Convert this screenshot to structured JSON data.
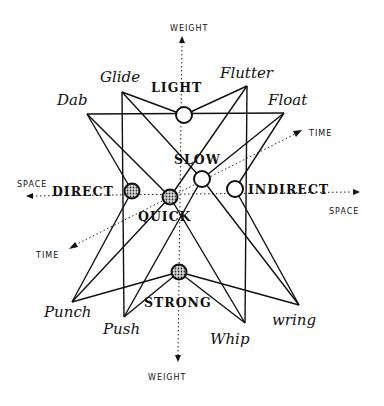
{
  "diagram": {
    "axes": {
      "weight_top": "WEIGHT",
      "weight_bottom": "WEIGHT",
      "space_left": "SPACE",
      "space_right": "SPACE",
      "time_top_right": "TIME",
      "time_bottom_left": "TIME"
    },
    "factors": {
      "light": "LIGHT",
      "strong": "STRONG",
      "direct": "DIRECT",
      "indirect": "INDIRECT",
      "quick": "QUICK",
      "slow": "SLOW"
    },
    "actions": {
      "dab": "Dab",
      "glide": "Glide",
      "flutter": "Flutter",
      "float": "Float",
      "punch": "Punch",
      "push": "Push",
      "whip": "Whip",
      "wring": "wring"
    },
    "nodes": [
      {
        "id": "light",
        "x": 184,
        "y": 115,
        "style": "open"
      },
      {
        "id": "strong",
        "x": 179,
        "y": 272,
        "style": "filled"
      },
      {
        "id": "direct",
        "x": 132,
        "y": 191,
        "style": "filled"
      },
      {
        "id": "indirect",
        "x": 235,
        "y": 189,
        "style": "open"
      },
      {
        "id": "quick",
        "x": 170,
        "y": 197,
        "style": "filled"
      },
      {
        "id": "slow",
        "x": 202,
        "y": 179,
        "style": "open"
      }
    ],
    "vertices": [
      {
        "id": "dab",
        "x": 87,
        "y": 114
      },
      {
        "id": "glide",
        "x": 122,
        "y": 92
      },
      {
        "id": "flutter",
        "x": 247,
        "y": 86
      },
      {
        "id": "float",
        "x": 284,
        "y": 113
      },
      {
        "id": "punch",
        "x": 72,
        "y": 302
      },
      {
        "id": "push",
        "x": 124,
        "y": 317
      },
      {
        "id": "whip",
        "x": 245,
        "y": 323
      },
      {
        "id": "wring",
        "x": 299,
        "y": 305
      }
    ],
    "edges": [
      [
        "dab",
        "float"
      ],
      [
        "glide",
        "light"
      ],
      [
        "light",
        "flutter"
      ],
      [
        "glide",
        "push"
      ],
      [
        "flutter",
        "whip"
      ],
      [
        "dab",
        "quick"
      ],
      [
        "quick",
        "whip"
      ],
      [
        "glide",
        "slow"
      ],
      [
        "slow",
        "wring"
      ],
      [
        "flutter",
        "quick"
      ],
      [
        "quick",
        "punch"
      ],
      [
        "float",
        "slow"
      ],
      [
        "slow",
        "push"
      ],
      [
        "dab",
        "direct"
      ],
      [
        "direct",
        "punch"
      ],
      [
        "float",
        "indirect"
      ],
      [
        "indirect",
        "wring"
      ],
      [
        "punch",
        "strong"
      ],
      [
        "strong",
        "wring"
      ],
      [
        "push",
        "strong"
      ],
      [
        "strong",
        "whip"
      ]
    ],
    "colors": {
      "ink": "#111111",
      "fill": "#555555",
      "background": "#ffffff"
    }
  }
}
